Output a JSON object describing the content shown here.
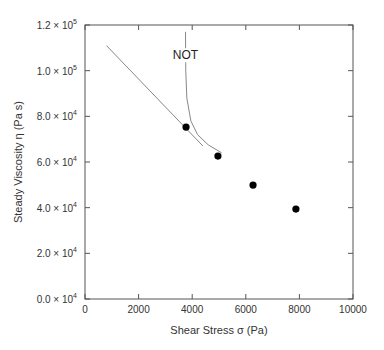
{
  "chart_data": {
    "type": "scatter",
    "title": "",
    "xlabel": "Shear Stress σ (Pa)",
    "ylabel": "Steady Viscosity η (Pa s)",
    "xlim": [
      0,
      10000
    ],
    "ylim": [
      0,
      120000
    ],
    "x_ticks": [
      "0",
      "2000",
      "4000",
      "6000",
      "8000",
      "10000"
    ],
    "y_ticks": [
      "0.0 × 10^4",
      "2.0 × 10^4",
      "4.0 × 10^4",
      "6.0 × 10^4",
      "8.0 × 10^4",
      "1.0 × 10^5",
      "1.2 × 10^5"
    ],
    "grid": false,
    "series": [
      {
        "name": "data",
        "marker": "filled-circle",
        "x": [
          3770,
          4960,
          6270,
          7870
        ],
        "y": [
          75300,
          62600,
          49900,
          39400
        ]
      },
      {
        "name": "straight-line-fit",
        "style": "thin-line",
        "x": [
          800,
          4400
        ],
        "y": [
          111000,
          67000
        ]
      },
      {
        "name": "NOT-curve",
        "style": "thin-curve",
        "x": [
          3750,
          3760,
          3800,
          3950,
          4200,
          4600,
          5100
        ],
        "y": [
          117000,
          100000,
          88000,
          78000,
          72000,
          67500,
          64000
        ]
      }
    ],
    "annotations": [
      {
        "text": "NOT",
        "x": 3750,
        "y": 105000
      }
    ]
  }
}
